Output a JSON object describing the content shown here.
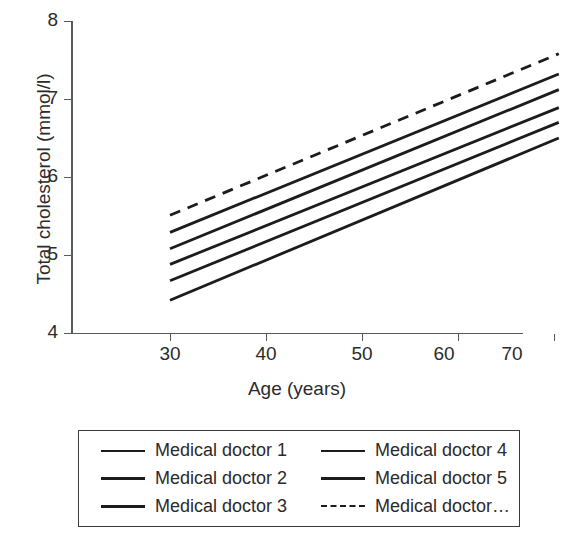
{
  "chart_data": {
    "type": "line",
    "title": "",
    "xlabel": "Age (years)",
    "ylabel": "Total cholesterol (mmol/l)",
    "xlim": [
      25,
      72
    ],
    "ylim": [
      4,
      8
    ],
    "xticks": [
      30,
      40,
      50,
      60,
      70
    ],
    "yticks": [
      4,
      5,
      6,
      7,
      8
    ],
    "xtick_labels": [
      "30",
      "40",
      "50",
      "60",
      "70"
    ],
    "ytick_labels": [
      "4",
      "5",
      "6",
      "7",
      "8"
    ],
    "grid": false,
    "legend_position": "below-plot",
    "x": [
      30,
      70.5
    ],
    "series": [
      {
        "name": "Medical doctor 1",
        "style": "solid",
        "color": "#1c1c1c",
        "values": [
          5.29,
          7.32
        ]
      },
      {
        "name": "Medical doctor 2",
        "style": "solid",
        "color": "#1c1c1c",
        "values": [
          5.08,
          7.12
        ]
      },
      {
        "name": "Medical doctor 3",
        "style": "solid",
        "color": "#1c1c1c",
        "values": [
          4.88,
          6.89
        ]
      },
      {
        "name": "Medical doctor 4",
        "style": "solid",
        "color": "#1c1c1c",
        "values": [
          4.67,
          6.7
        ]
      },
      {
        "name": "Medical doctor 5",
        "style": "solid",
        "color": "#1c1c1c",
        "values": [
          4.42,
          6.5
        ]
      },
      {
        "name": "Medical doctor…",
        "style": "dashed",
        "color": "#1c1c1c",
        "values": [
          5.51,
          7.58
        ]
      }
    ]
  },
  "axes": {
    "ylabel": "Total cholesterol (mmol/l)",
    "xlabel": "Age (years)",
    "yticks": [
      {
        "label": "8"
      },
      {
        "label": "7"
      },
      {
        "label": "6"
      },
      {
        "label": "5"
      },
      {
        "label": "4"
      }
    ],
    "xticks": [
      {
        "label": "30"
      },
      {
        "label": "40"
      },
      {
        "label": "50"
      },
      {
        "label": "60"
      },
      {
        "label": "70"
      }
    ]
  },
  "legend": {
    "entries": [
      {
        "label": "Medical doctor 1",
        "style": "solid"
      },
      {
        "label": "Medical doctor 4",
        "style": "solid"
      },
      {
        "label": "Medical doctor 2",
        "style": "solid"
      },
      {
        "label": "Medical doctor 5",
        "style": "solid"
      },
      {
        "label": "Medical doctor 3",
        "style": "solid"
      },
      {
        "label": "Medical doctor…",
        "style": "dashed"
      }
    ]
  }
}
